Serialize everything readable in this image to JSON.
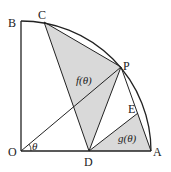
{
  "diagram": {
    "points": {
      "O": {
        "label": "O",
        "x": 21,
        "y": 151
      },
      "A": {
        "label": "A",
        "x": 151,
        "y": 151
      },
      "B": {
        "label": "B",
        "x": 21,
        "y": 22
      },
      "C": {
        "label": "C",
        "x": 44,
        "y": 22
      },
      "P": {
        "label": "P",
        "x": 121,
        "y": 67
      },
      "D": {
        "label": "D",
        "x": 89,
        "y": 151
      },
      "E": {
        "label": "E",
        "x": 138,
        "y": 113
      }
    },
    "angle_label": "θ",
    "region_f_label": "f(θ)",
    "region_g_label": "g(θ)",
    "shade_color": "#d9d9d9",
    "line_color": "#222222"
  }
}
